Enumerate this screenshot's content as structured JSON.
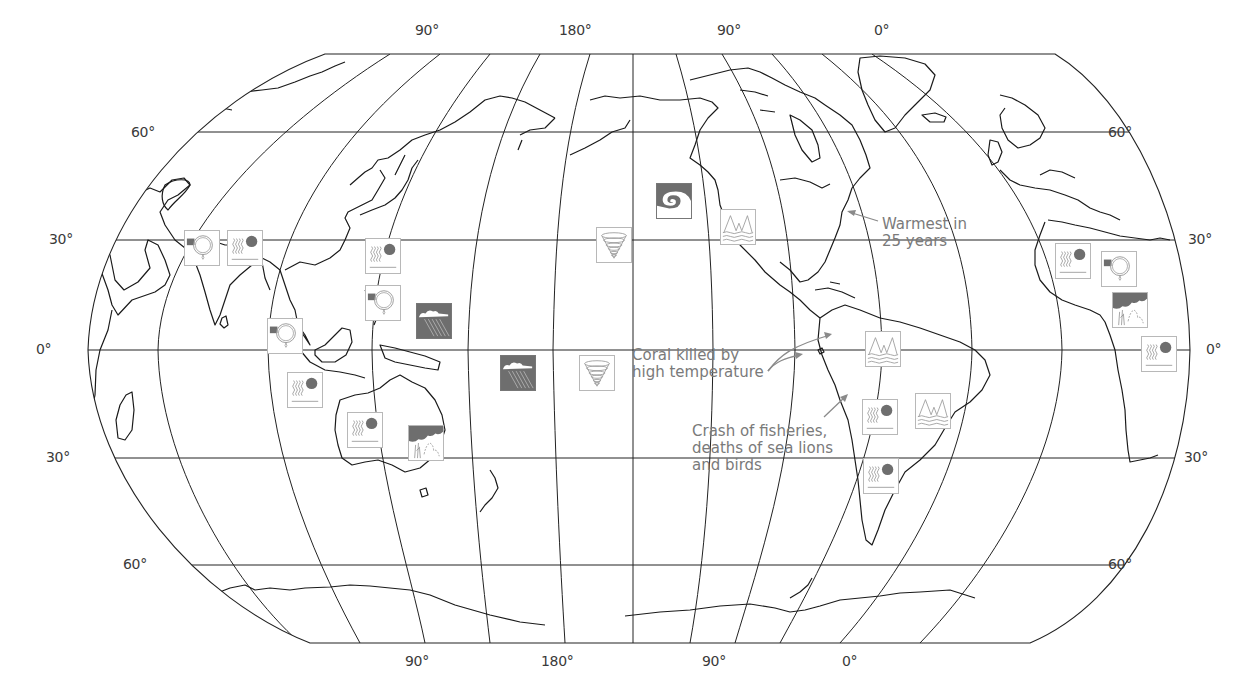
{
  "map": {
    "projection": "Robinson (Pacific-centered)",
    "colors": {
      "coastline": "#1a1a1a",
      "grid": "#222222",
      "icon_gray": "#6e6e6e",
      "icon_border": "#b8b8b8",
      "annotation_text": "#7a7a7a",
      "label_text": "#3a3a3a"
    },
    "longitude_labels_top": [
      {
        "text": "90°",
        "x": 415,
        "y": 22
      },
      {
        "text": "180°",
        "x": 559,
        "y": 22
      },
      {
        "text": "90°",
        "x": 717,
        "y": 22
      },
      {
        "text": "0°",
        "x": 874,
        "y": 22
      }
    ],
    "longitude_labels_bottom": [
      {
        "text": "90°",
        "x": 405,
        "y": 653
      },
      {
        "text": "180°",
        "x": 541,
        "y": 653
      },
      {
        "text": "90°",
        "x": 702,
        "y": 653
      },
      {
        "text": "0°",
        "x": 842,
        "y": 653
      }
    ],
    "latitude_labels_left": [
      {
        "text": "60°",
        "x": 131,
        "y": 124
      },
      {
        "text": "30°",
        "x": 49,
        "y": 231
      },
      {
        "text": "0°",
        "x": 36,
        "y": 341
      },
      {
        "text": "30°",
        "x": 46,
        "y": 449
      },
      {
        "text": "60°",
        "x": 123,
        "y": 556
      }
    ],
    "latitude_labels_right": [
      {
        "text": "60°",
        "x": 1108,
        "y": 124
      },
      {
        "text": "30°",
        "x": 1188,
        "y": 231
      },
      {
        "text": "0°",
        "x": 1206,
        "y": 341
      },
      {
        "text": "30°",
        "x": 1184,
        "y": 449
      },
      {
        "text": "60°",
        "x": 1108,
        "y": 556
      }
    ],
    "annotations": [
      {
        "id": "warmest",
        "lines": [
          "Warmest in",
          "25 years"
        ],
        "x": 882,
        "y": 216
      },
      {
        "id": "coral",
        "lines": [
          "Coral killed by",
          "high temperature"
        ],
        "x": 632,
        "y": 347
      },
      {
        "id": "fisheries",
        "lines": [
          "Crash of fisheries,",
          "deaths of sea lions",
          "and birds"
        ],
        "x": 692,
        "y": 423
      }
    ],
    "icons": [
      {
        "type": "drought",
        "region": "India (northwest)",
        "x": 184,
        "y": 230
      },
      {
        "type": "heat",
        "region": "India (northeast)",
        "x": 227,
        "y": 230
      },
      {
        "type": "heat",
        "region": "China (south)",
        "x": 365,
        "y": 238
      },
      {
        "type": "drought",
        "region": "Philippines",
        "x": 365,
        "y": 285
      },
      {
        "type": "drought",
        "region": "Southeast Asia",
        "x": 267,
        "y": 318
      },
      {
        "type": "heavy-rain",
        "region": "Micronesia",
        "x": 416,
        "y": 303
      },
      {
        "type": "heat",
        "region": "Indonesia",
        "x": 287,
        "y": 372
      },
      {
        "type": "heat",
        "region": "Australia (northwest)",
        "x": 347,
        "y": 412
      },
      {
        "type": "wildfire",
        "region": "Australia (east)",
        "x": 408,
        "y": 425
      },
      {
        "type": "heavy-rain",
        "region": "Central Pacific",
        "x": 500,
        "y": 355
      },
      {
        "type": "tropical-storm",
        "region": "Hawaii",
        "x": 596,
        "y": 227
      },
      {
        "type": "tropical-storm",
        "region": "South Pacific",
        "x": 579,
        "y": 355
      },
      {
        "type": "wind-storm",
        "region": "Gulf of Alaska",
        "x": 656,
        "y": 183
      },
      {
        "type": "flooding",
        "region": "California",
        "x": 720,
        "y": 209
      },
      {
        "type": "flooding",
        "region": "Northern South America",
        "x": 865,
        "y": 331
      },
      {
        "type": "flooding",
        "region": "Eastern Brazil",
        "x": 915,
        "y": 393
      },
      {
        "type": "heat",
        "region": "Southern Brazil",
        "x": 862,
        "y": 399
      },
      {
        "type": "heat",
        "region": "Argentina",
        "x": 863,
        "y": 458
      },
      {
        "type": "heat",
        "region": "West Africa",
        "x": 1055,
        "y": 243
      },
      {
        "type": "drought",
        "region": "Sahel",
        "x": 1101,
        "y": 251
      },
      {
        "type": "wildfire",
        "region": "Central Africa",
        "x": 1112,
        "y": 292
      },
      {
        "type": "heat",
        "region": "Southern Africa",
        "x": 1141,
        "y": 336
      }
    ]
  }
}
